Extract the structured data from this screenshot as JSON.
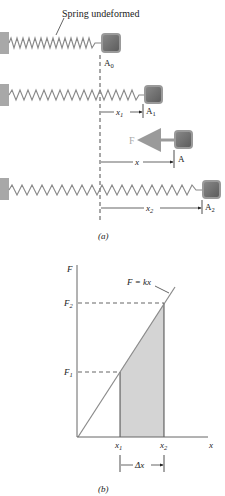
{
  "figure_a": {
    "caption": "(a)",
    "annotation": "Spring undeformed",
    "positions": [
      {
        "label": "A",
        "sub": "0"
      },
      {
        "label": "A",
        "sub": "1"
      },
      {
        "label": "A",
        "sub": ""
      },
      {
        "label": "A",
        "sub": "2"
      }
    ],
    "dimensions": [
      {
        "label": "x",
        "sub": "1"
      },
      {
        "label": "x",
        "sub": ""
      },
      {
        "label": "x",
        "sub": "2"
      }
    ],
    "force_label": "F"
  },
  "figure_b": {
    "caption": "(b)",
    "y_axis_label": "F",
    "x_axis_label": "x",
    "line_label": "F = kx",
    "y_ticks": [
      {
        "label": "F",
        "sub": "1"
      },
      {
        "label": "F",
        "sub": "2"
      }
    ],
    "x_ticks": [
      {
        "label": "x",
        "sub": "1"
      },
      {
        "label": "x",
        "sub": "2"
      }
    ],
    "interval_label": "Δx"
  },
  "colors": {
    "block": "#6e6e6e",
    "block_border": "#9a9a9a",
    "wall": "#a8a8a8",
    "shade": "#d4d4d4",
    "line": "#8a8a8a",
    "force_arrow": "#9a9a9a"
  }
}
